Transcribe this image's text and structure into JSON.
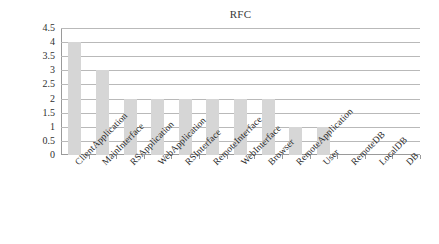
{
  "chart_data": {
    "type": "bar",
    "title": "RFC",
    "xlabel": "",
    "ylabel": "",
    "ylim": [
      0,
      4.5
    ],
    "ytick_values": [
      0,
      0.5,
      1,
      1.5,
      2,
      2.5,
      3,
      3.5,
      4,
      4.5
    ],
    "ytick_labels": [
      "0",
      "0.5",
      "1",
      "1.5",
      "2",
      "2.5",
      "3",
      "3.5",
      "4",
      "4.5"
    ],
    "grid": true,
    "legend": false,
    "bar_color": "#d6d6d6",
    "categories": [
      "ClientApplication",
      "MainInterface",
      "RSApplication",
      "WebApplication",
      "RSInterface",
      "RemoteInterface",
      "WebInterface",
      "Browser",
      "RemoteApplication",
      "User",
      "RemoteDB",
      "LocalDB",
      "DB"
    ],
    "values": [
      4,
      3,
      2,
      2,
      2,
      2,
      2,
      2,
      1,
      1,
      0,
      0,
      0
    ]
  }
}
